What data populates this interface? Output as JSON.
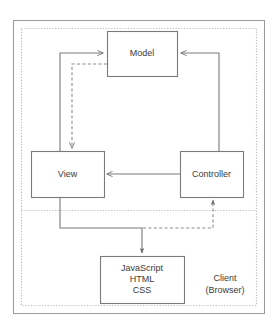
{
  "diagram": {
    "title_fragment": "",
    "type": "flow-diagram",
    "colors": {
      "box_border": "#7a7a7a",
      "box_fill": "#ffffff",
      "arrow_solid": "#7a7a7a",
      "arrow_dashed": "#8a8a8a",
      "zone_border": "#b5b5b5",
      "outer_border": "#9a9a9a",
      "text": "#3a3a3a",
      "background": "#ffffff"
    },
    "nodes": [
      {
        "id": "model",
        "label": "Model",
        "x": 107,
        "y": 31,
        "w": 70,
        "h": 45
      },
      {
        "id": "view",
        "label": "View",
        "x": 31,
        "y": 151,
        "w": 73,
        "h": 46
      },
      {
        "id": "controller",
        "label": "Controller",
        "x": 180,
        "y": 151,
        "w": 63,
        "h": 46
      },
      {
        "id": "assets",
        "label": "JavaScript\nHTML\nCSS",
        "line1": "JavaScript",
        "line2": "HTML",
        "line3": "CSS",
        "x": 100,
        "y": 256,
        "w": 84,
        "h": 47
      }
    ],
    "zones": [
      {
        "id": "client",
        "label_line1": "Client",
        "label_line2": "(Browser)",
        "style": "dotted"
      }
    ],
    "edges": [
      {
        "from": "view",
        "to": "model",
        "style": "solid",
        "arrow": "to-model-left"
      },
      {
        "from": "model",
        "to": "view",
        "style": "dashed",
        "arrow": "to-view-top"
      },
      {
        "from": "controller",
        "to": "model",
        "style": "solid",
        "arrow": "to-model-right"
      },
      {
        "from": "controller",
        "to": "view",
        "style": "solid",
        "arrow": "to-view-right"
      },
      {
        "from": "view",
        "to": "assets",
        "style": "solid",
        "arrow": "to-assets-top"
      },
      {
        "from": "assets",
        "to": "controller",
        "style": "dashed",
        "arrow": "to-controller-bottom"
      }
    ]
  }
}
